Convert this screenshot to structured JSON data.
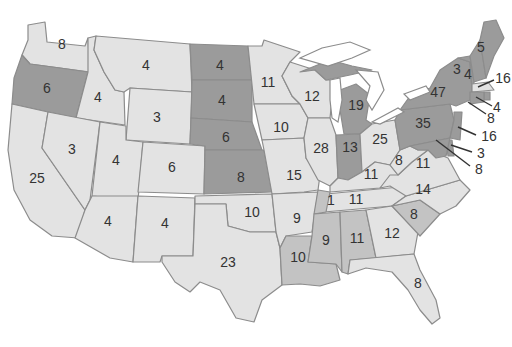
{
  "map": {
    "title": "",
    "colors": {
      "dark": "#9b9b9b",
      "medium": "#c3c3c3",
      "light": "#e3e3e3",
      "border": "#8c8c8c",
      "text": "#333333"
    },
    "states": {
      "WA": {
        "value": "8",
        "shade": "light"
      },
      "OR": {
        "value": "6",
        "shade": "dark"
      },
      "CA": {
        "value": "25",
        "shade": "light"
      },
      "ID": {
        "value": "4",
        "shade": "light"
      },
      "NV": {
        "value": "3",
        "shade": "light"
      },
      "MT": {
        "value": "4",
        "shade": "light"
      },
      "WY": {
        "value": "3",
        "shade": "light"
      },
      "UT": {
        "value": "4",
        "shade": "light"
      },
      "CO": {
        "value": "6",
        "shade": "light"
      },
      "AZ": {
        "value": "4",
        "shade": "light"
      },
      "NM": {
        "value": "4",
        "shade": "light"
      },
      "ND": {
        "value": "4",
        "shade": "dark"
      },
      "SD": {
        "value": "4",
        "shade": "dark"
      },
      "NE": {
        "value": "6",
        "shade": "dark"
      },
      "KS": {
        "value": "8",
        "shade": "dark"
      },
      "OK": {
        "value": "10",
        "shade": "light"
      },
      "TX": {
        "value": "23",
        "shade": "light"
      },
      "MN": {
        "value": "11",
        "shade": "light"
      },
      "IA": {
        "value": "10",
        "shade": "light"
      },
      "MO": {
        "value": "15",
        "shade": "light"
      },
      "AR": {
        "value": "9",
        "shade": "light"
      },
      "LA": {
        "value": "10",
        "shade": "medium"
      },
      "WI": {
        "value": "12",
        "shade": "light"
      },
      "IL": {
        "value": "28",
        "shade": "light"
      },
      "MI": {
        "value": "19",
        "shade": "dark"
      },
      "IN": {
        "value": "13",
        "shade": "dark"
      },
      "OH": {
        "value": "25",
        "shade": "light"
      },
      "KY": {
        "value": "11",
        "shade": "light"
      },
      "TN": {
        "value": "11",
        "shade": "light"
      },
      "TN_split": {
        "value": "1",
        "shade": "medium"
      },
      "MS": {
        "value": "9",
        "shade": "medium"
      },
      "AL": {
        "value": "11",
        "shade": "medium"
      },
      "GA": {
        "value": "12",
        "shade": "light"
      },
      "FL": {
        "value": "8",
        "shade": "light"
      },
      "SC": {
        "value": "8",
        "shade": "medium"
      },
      "NC": {
        "value": "14",
        "shade": "light"
      },
      "VA": {
        "value": "11",
        "shade": "light"
      },
      "WV": {
        "value": "8",
        "shade": "light"
      },
      "PA": {
        "value": "35",
        "shade": "dark"
      },
      "NY": {
        "value": "47",
        "shade": "dark"
      },
      "VT": {
        "value": "3",
        "shade": "dark"
      },
      "NH": {
        "value": "4",
        "shade": "dark"
      },
      "ME": {
        "value": "5",
        "shade": "dark"
      },
      "MA": {
        "value": "16",
        "shade": "light"
      },
      "RI": {
        "value": "4",
        "shade": "dark"
      },
      "CT": {
        "value": "8",
        "shade": "dark"
      },
      "NJ": {
        "value": "16",
        "shade": "dark"
      },
      "DE": {
        "value": "3",
        "shade": "dark"
      },
      "MD": {
        "value": "8",
        "shade": "dark"
      }
    }
  }
}
